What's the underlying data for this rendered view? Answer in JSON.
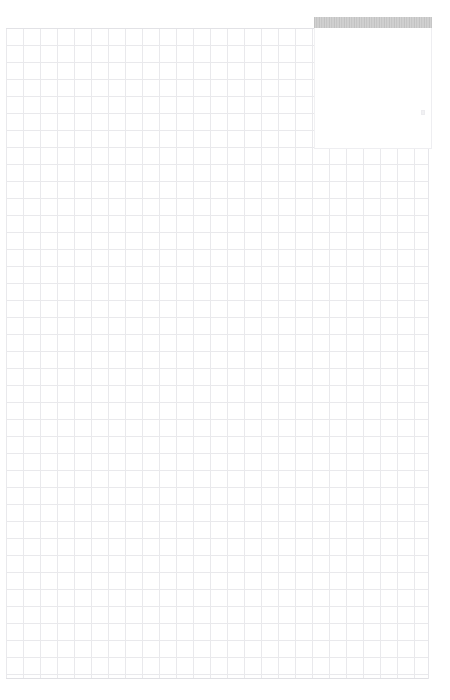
{
  "app": {
    "name": "grid-canvas-viewer",
    "background_color": "#ffffff"
  },
  "canvas": {
    "name": "graph-paper-grid",
    "grid_line_color": "#e9e9ec",
    "grid_cell_size_px": 17,
    "left_px": 6,
    "top_px": 28,
    "width_px": 423,
    "height_px": 651,
    "border_color": "#e2e2e6"
  },
  "overlay_panel": {
    "title": "",
    "title_bar_color": "#c9c9c9",
    "body_color": "#ffffff",
    "border_color": "#ededf0",
    "left_px": 314,
    "top_px": 17,
    "width_px": 118,
    "height_px": 132,
    "body_content": ""
  },
  "artifact": {
    "label": "",
    "color": "#f0f0f2"
  }
}
